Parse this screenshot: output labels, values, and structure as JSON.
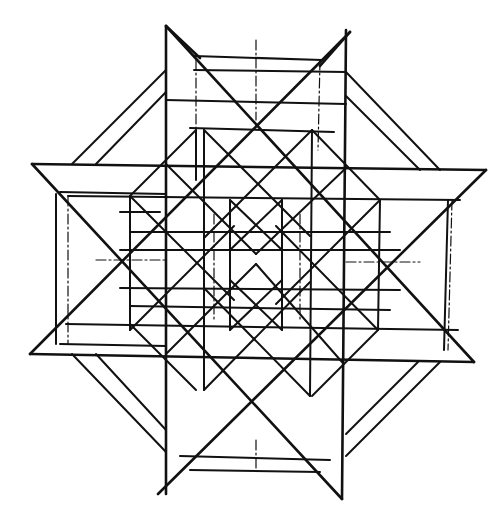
{
  "diagram": {
    "title": "",
    "stroke_color": "#111111",
    "background": "#ffffff",
    "thick_lines": [
      [
        166,
        26,
        166,
        494
      ],
      [
        346,
        30,
        342,
        499
      ],
      [
        32,
        164,
        486,
        170
      ],
      [
        30,
        354,
        474,
        362
      ],
      [
        166,
        26,
        474,
        362
      ],
      [
        350,
        32,
        30,
        354
      ],
      [
        32,
        164,
        342,
        499
      ],
      [
        486,
        170,
        158,
        494
      ],
      [
        166,
        26,
        200,
        58
      ],
      [
        350,
        32,
        320,
        66
      ]
    ],
    "medium_lines": [
      [
        166,
        70,
        72,
        164
      ],
      [
        346,
        72,
        440,
        170
      ],
      [
        72,
        354,
        166,
        452
      ],
      [
        440,
        362,
        346,
        456
      ],
      [
        166,
        92,
        96,
        164
      ],
      [
        346,
        96,
        420,
        170
      ],
      [
        96,
        354,
        166,
        430
      ],
      [
        418,
        362,
        346,
        434
      ],
      [
        194,
        56,
        322,
        60
      ],
      [
        194,
        70,
        346,
        72
      ],
      [
        166,
        100,
        346,
        104
      ],
      [
        190,
        128,
        334,
        132
      ],
      [
        56,
        194,
        56,
        344
      ],
      [
        448,
        200,
        444,
        350
      ],
      [
        68,
        196,
        460,
        200
      ],
      [
        66,
        324,
        458,
        330
      ],
      [
        180,
        456,
        330,
        460
      ],
      [
        190,
        470,
        320,
        472
      ],
      [
        60,
        192,
        166,
        194
      ],
      [
        60,
        344,
        166,
        346
      ],
      [
        204,
        130,
        204,
        390
      ],
      [
        312,
        130,
        310,
        396
      ],
      [
        130,
        196,
        130,
        330
      ],
      [
        380,
        200,
        378,
        330
      ],
      [
        120,
        212,
        160,
        212
      ],
      [
        196,
        130,
        196,
        180
      ],
      [
        230,
        200,
        230,
        330
      ],
      [
        282,
        200,
        282,
        330
      ],
      [
        120,
        250,
        400,
        250
      ],
      [
        120,
        288,
        400,
        290
      ],
      [
        130,
        232,
        390,
        232
      ],
      [
        130,
        306,
        390,
        310
      ]
    ],
    "thin_lines": [
      [
        68,
        196,
        68,
        344
      ],
      [
        452,
        200,
        448,
        350
      ],
      [
        196,
        60,
        196,
        150
      ],
      [
        320,
        60,
        318,
        150
      ],
      [
        256,
        40,
        256,
        120
      ],
      [
        256,
        440,
        256,
        470
      ],
      [
        96,
        260,
        166,
        260
      ],
      [
        346,
        262,
        420,
        262
      ],
      [
        214,
        214,
        214,
        320
      ],
      [
        300,
        214,
        300,
        320
      ]
    ],
    "diagonal_grid": [
      [
        166,
        164,
        256,
        254
      ],
      [
        256,
        254,
        346,
        168
      ],
      [
        166,
        354,
        256,
        264
      ],
      [
        256,
        264,
        342,
        362
      ],
      [
        204,
        130,
        310,
        236
      ],
      [
        312,
        130,
        204,
        238
      ],
      [
        204,
        390,
        310,
        282
      ],
      [
        310,
        396,
        204,
        288
      ],
      [
        130,
        196,
        234,
        300
      ],
      [
        380,
        200,
        276,
        304
      ],
      [
        130,
        330,
        234,
        226
      ],
      [
        378,
        330,
        276,
        226
      ],
      [
        196,
        130,
        130,
        196
      ],
      [
        312,
        130,
        380,
        200
      ],
      [
        196,
        390,
        130,
        324
      ],
      [
        312,
        396,
        378,
        330
      ],
      [
        230,
        200,
        282,
        250
      ],
      [
        282,
        200,
        230,
        250
      ],
      [
        230,
        330,
        282,
        280
      ],
      [
        282,
        330,
        230,
        280
      ]
    ]
  }
}
